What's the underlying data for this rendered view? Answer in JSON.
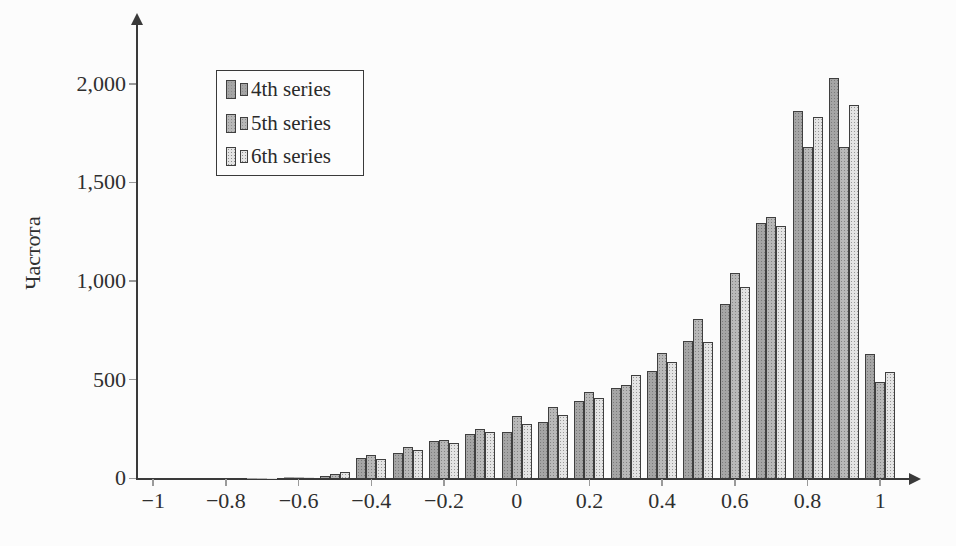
{
  "figure": {
    "background": "#fcfcfc",
    "axis_color": "#3a3a3a",
    "tick_color": "#9a9a9a"
  },
  "chart_data": {
    "type": "bar",
    "subtype": "grouped-histogram",
    "title": "",
    "xlabel": "",
    "ylabel": "Частота",
    "grid": false,
    "legend_position": "top-left-inside",
    "bin_width": 0.1,
    "xlim": [
      -1.05,
      1.09
    ],
    "ylim": [
      0,
      2300
    ],
    "categories": [
      -0.7,
      -0.6,
      -0.5,
      -0.4,
      -0.3,
      -0.2,
      -0.1,
      0,
      0.1,
      0.2,
      0.3,
      0.4,
      0.5,
      0.6,
      0.7,
      0.8,
      0.9,
      1.0
    ],
    "series": [
      {
        "name": "4th series",
        "color": "#a5a5a5",
        "values": [
          2,
          5,
          14,
          105,
          130,
          187,
          224,
          234,
          283,
          391,
          456,
          545,
          694,
          886,
          1294,
          1864,
          2032,
          631
        ]
      },
      {
        "name": "5th series",
        "color": "#b8b8b8",
        "values": [
          2,
          6,
          20,
          116,
          158,
          196,
          249,
          316,
          362,
          440,
          474,
          636,
          810,
          1043,
          1326,
          1679,
          1682,
          486
        ]
      },
      {
        "name": "6th series",
        "color": "#e4e4e4",
        "values": [
          3,
          8,
          34,
          99,
          143,
          178,
          235,
          274,
          321,
          406,
          526,
          591,
          689,
          969,
          1277,
          1834,
          1892,
          538
        ]
      }
    ],
    "x_ticks": [
      {
        "value": -1,
        "label": "−1"
      },
      {
        "value": -0.8,
        "label": "−0.8"
      },
      {
        "value": -0.6,
        "label": "−0.6"
      },
      {
        "value": -0.4,
        "label": "−0.4"
      },
      {
        "value": -0.2,
        "label": "−0.2"
      },
      {
        "value": 0,
        "label": "0"
      },
      {
        "value": 0.2,
        "label": "0.2"
      },
      {
        "value": 0.4,
        "label": "0.4"
      },
      {
        "value": 0.6,
        "label": "0.6"
      },
      {
        "value": 0.8,
        "label": "0.8"
      },
      {
        "value": 1,
        "label": "1"
      }
    ],
    "y_ticks": [
      {
        "value": 0,
        "label": "0"
      },
      {
        "value": 500,
        "label": "500"
      },
      {
        "value": 1000,
        "label": "1,000"
      },
      {
        "value": 1500,
        "label": "1,500"
      },
      {
        "value": 2000,
        "label": "2,000"
      }
    ]
  }
}
